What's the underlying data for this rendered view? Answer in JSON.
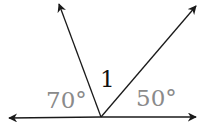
{
  "diagram": {
    "type": "angles-on-a-line",
    "labels": {
      "left_angle": "70°",
      "middle_angle": "1",
      "right_angle": "50°"
    },
    "colors": {
      "lines": "#1a1a1a",
      "angle_labels": "#8a8a8a",
      "middle_label": "#111111"
    }
  }
}
